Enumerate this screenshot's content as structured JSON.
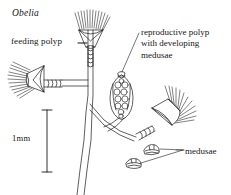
{
  "figure": {
    "taxon": "Obelia",
    "background_color": "#ffffff",
    "ink_color": "#1a1a1a",
    "width": 231,
    "height": 195
  },
  "labels": {
    "feeding_polyp": "feeding polyp",
    "reproductive_polyp_line1": "reproductive polyp",
    "reproductive_polyp_line2": "with developing",
    "reproductive_polyp_line3": "medusae",
    "medusae": "medusae"
  },
  "scale_bar": {
    "text": "1mm",
    "length_px": 62
  },
  "structures": {
    "feeding_polyps": 3,
    "reproductive_polyps": 1,
    "free_medusae": 2,
    "developing_medusae_in_gonangium": 11,
    "tentacles_per_polyp": 13
  }
}
